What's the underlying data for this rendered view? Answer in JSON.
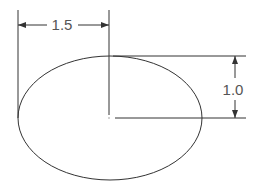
{
  "drawing": {
    "shape": "ellipse",
    "stroke_color": "#333333",
    "dimensions": {
      "horizontal": {
        "label": "1.5",
        "description": "semi-major axis"
      },
      "vertical": {
        "label": "1.0",
        "description": "semi-minor axis"
      }
    }
  }
}
